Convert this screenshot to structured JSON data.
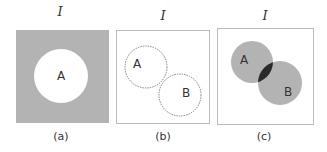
{
  "figure": {
    "panels": [
      {
        "id": "a",
        "universe_label": "I",
        "caption": "(a)",
        "sets": [
          "A"
        ],
        "shading": "complement of A",
        "colors": {
          "fill": "#b3b3b3",
          "hole": "#ffffff"
        }
      },
      {
        "id": "b",
        "universe_label": "I",
        "caption": "(b)",
        "sets": [
          "A",
          "B"
        ],
        "shading": "intersection of A and B",
        "colors": {
          "intersection": "#2a2a2a",
          "outline": "#555555"
        }
      },
      {
        "id": "c",
        "universe_label": "I",
        "caption": "(c)",
        "sets": [
          "A",
          "B"
        ],
        "shading": "union of A and B, intersection darker",
        "colors": {
          "union": "#b3b3b3",
          "intersection": "#2a2a2a"
        }
      }
    ]
  }
}
